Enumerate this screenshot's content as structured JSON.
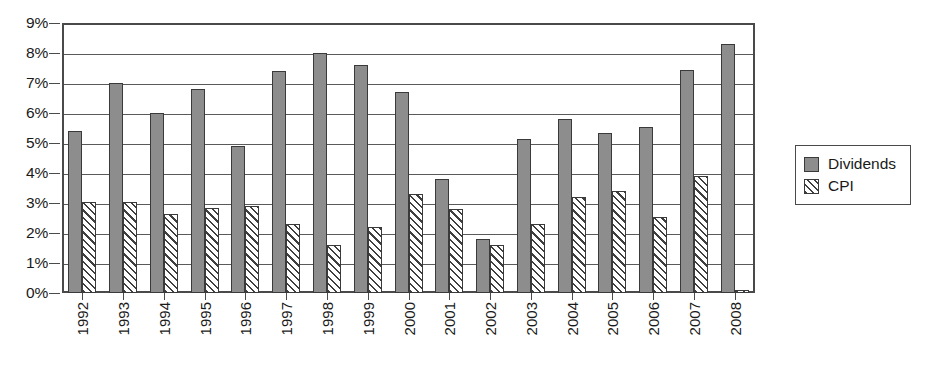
{
  "chart_data": {
    "type": "bar",
    "title": "",
    "subtitle": "",
    "xlabel": "",
    "ylabel": "",
    "ylim": [
      0,
      9
    ],
    "ytick_labels": [
      "0%",
      "1%",
      "2%",
      "3%",
      "4%",
      "5%",
      "6%",
      "7%",
      "8%",
      "9%"
    ],
    "ytick_values": [
      0,
      1,
      2,
      3,
      4,
      5,
      6,
      7,
      8,
      9
    ],
    "grid": true,
    "legend_position": "right",
    "categories": [
      "1992",
      "1993",
      "1994",
      "1995",
      "1996",
      "1997",
      "1998",
      "1999",
      "2000",
      "2001",
      "2002",
      "2003",
      "2004",
      "2005",
      "2006",
      "2007",
      "2008"
    ],
    "series": [
      {
        "name": "Dividends",
        "color": "#8d8d8d",
        "pattern": "solid",
        "values": [
          5.4,
          7.0,
          6.0,
          6.8,
          4.9,
          7.4,
          8.0,
          7.6,
          6.7,
          3.8,
          1.8,
          5.15,
          5.8,
          5.35,
          5.55,
          7.45,
          8.3
        ]
      },
      {
        "name": "CPI",
        "color": "#ffffff",
        "pattern": "diagonal-hatch",
        "values": [
          3.05,
          3.05,
          2.65,
          2.85,
          2.9,
          2.3,
          1.6,
          2.2,
          3.3,
          2.8,
          1.6,
          2.3,
          3.2,
          3.4,
          2.55,
          3.9,
          0.1
        ]
      }
    ]
  },
  "legend": {
    "items": [
      {
        "label": "Dividends",
        "swatch": "solid-gray-swatch"
      },
      {
        "label": "CPI",
        "swatch": "hatched-swatch"
      }
    ]
  }
}
